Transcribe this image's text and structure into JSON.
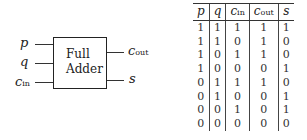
{
  "diagram": {
    "block_label_line1": "Full",
    "block_label_line2": "Adder",
    "inputs": [
      {
        "name": "p",
        "sub": ""
      },
      {
        "name": "q",
        "sub": ""
      },
      {
        "name": "c",
        "sub": "in"
      }
    ],
    "outputs": [
      {
        "name": "c",
        "sub": "out"
      },
      {
        "name": "s",
        "sub": ""
      }
    ]
  },
  "truth_table": {
    "headers": [
      {
        "name": "p",
        "sub": ""
      },
      {
        "name": "q",
        "sub": ""
      },
      {
        "name": "c",
        "sub": "in"
      },
      {
        "name": "c",
        "sub": "out"
      },
      {
        "name": "s",
        "sub": ""
      }
    ],
    "rows": [
      [
        "1",
        "1",
        "1",
        "1",
        "1"
      ],
      [
        "1",
        "1",
        "0",
        "1",
        "0"
      ],
      [
        "1",
        "0",
        "1",
        "1",
        "0"
      ],
      [
        "1",
        "0",
        "0",
        "0",
        "1"
      ],
      [
        "0",
        "1",
        "1",
        "1",
        "0"
      ],
      [
        "0",
        "1",
        "0",
        "0",
        "1"
      ],
      [
        "0",
        "0",
        "1",
        "0",
        "1"
      ],
      [
        "0",
        "0",
        "0",
        "0",
        "0"
      ]
    ]
  }
}
